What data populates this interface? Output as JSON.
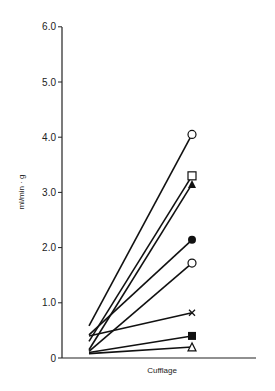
{
  "chart_data": {
    "type": "line",
    "title": "",
    "xlabel": "Cufflage",
    "ylabel": "ml/min · g",
    "ylim": [
      0,
      6.0
    ],
    "yticks": [
      "0",
      "1.0",
      "2.0",
      "3.0",
      "4.0",
      "5.0",
      "6.0"
    ],
    "grid": false,
    "legend": "none",
    "x": [
      "before",
      "Cufflage"
    ],
    "series": [
      {
        "name": "open-circle-1",
        "marker": "open-circle",
        "values": [
          0.58,
          4.05
        ]
      },
      {
        "name": "open-square",
        "marker": "open-square",
        "values": [
          0.3,
          3.3
        ]
      },
      {
        "name": "filled-triangle",
        "marker": "filled-triangle",
        "values": [
          0.15,
          3.15
        ]
      },
      {
        "name": "filled-circle",
        "marker": "filled-circle",
        "values": [
          0.42,
          2.14
        ]
      },
      {
        "name": "open-circle-2",
        "marker": "open-circle",
        "values": [
          0.12,
          1.72
        ]
      },
      {
        "name": "cross",
        "marker": "cross",
        "values": [
          0.4,
          0.82
        ]
      },
      {
        "name": "filled-square",
        "marker": "filled-square",
        "values": [
          0.1,
          0.4
        ]
      },
      {
        "name": "open-triangle",
        "marker": "open-triangle",
        "values": [
          0.08,
          0.2
        ]
      }
    ]
  }
}
